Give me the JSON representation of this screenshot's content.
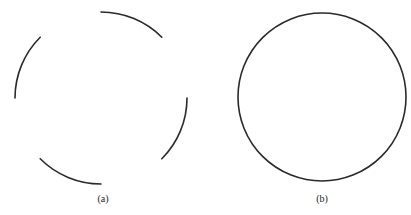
{
  "figure": {
    "panels": [
      {
        "id": "a",
        "label": "(a)",
        "description": "Dashed circle made of four separate 45-degree arcs",
        "center": [
          101,
          98
        ],
        "radius": 86,
        "stroke_color": "#2a2a2a",
        "arcs_deg": [
          [
            0,
            45
          ],
          [
            90,
            135
          ],
          [
            180,
            225
          ],
          [
            270,
            315
          ]
        ]
      },
      {
        "id": "b",
        "label": "(b)",
        "description": "Complete closed circle",
        "center": [
          322,
          97
        ],
        "radius": 84,
        "stroke_color": "#2a2a2a"
      }
    ]
  }
}
